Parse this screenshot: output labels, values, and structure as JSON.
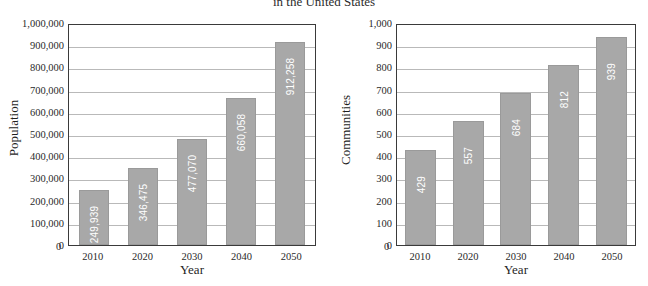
{
  "title": "in the United States",
  "chart_data": [
    {
      "type": "bar",
      "name": "population-chart",
      "title": "",
      "xlabel": "Year",
      "ylabel": "Population",
      "categories": [
        "2010",
        "2020",
        "2030",
        "2040",
        "2050"
      ],
      "values": [
        249939,
        346475,
        477070,
        660058,
        912258
      ],
      "value_labels": [
        "249,939",
        "346,475",
        "477,070",
        "660,058",
        "912,258"
      ],
      "ylim": [
        0,
        1000000
      ],
      "ytick_values": [
        0,
        100000,
        200000,
        300000,
        400000,
        500000,
        600000,
        700000,
        800000,
        900000,
        1000000
      ],
      "ytick_labels": [
        "0",
        "100,000",
        "200,000",
        "300,000",
        "400,000",
        "500,000",
        "600,000",
        "700,000",
        "800,000",
        "900,000",
        "1,000,000"
      ],
      "grid": true,
      "legend": "none",
      "bar_color": "#a8a8a8",
      "label_color": "#ffffff"
    },
    {
      "type": "bar",
      "name": "communities-chart",
      "title": "",
      "xlabel": "Year",
      "ylabel": "Communities",
      "categories": [
        "2010",
        "2020",
        "2030",
        "2040",
        "2050"
      ],
      "values": [
        429,
        557,
        684,
        812,
        939
      ],
      "value_labels": [
        "429",
        "557",
        "684",
        "812",
        "939"
      ],
      "ylim": [
        0,
        1000
      ],
      "ytick_values": [
        0,
        100,
        200,
        300,
        400,
        500,
        600,
        700,
        800,
        900,
        1000
      ],
      "ytick_labels": [
        "0",
        "100",
        "200",
        "300",
        "400",
        "500",
        "600",
        "700",
        "800",
        "900",
        "1,000"
      ],
      "grid": true,
      "legend": "none",
      "bar_color": "#a8a8a8",
      "label_color": "#ffffff"
    }
  ]
}
